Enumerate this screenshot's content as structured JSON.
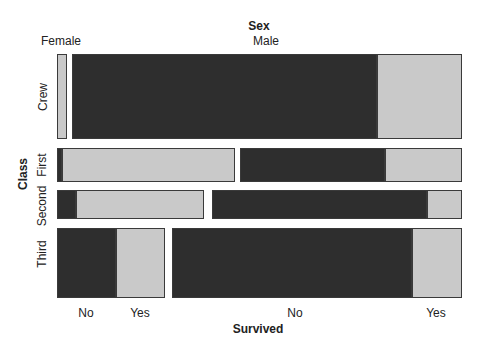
{
  "chart_data": {
    "type": "mosaic",
    "axes": {
      "top": {
        "title": "Sex",
        "category_labels": [
          {
            "text": "Female",
            "x": 61,
            "y": 41
          },
          {
            "text": "Male",
            "x": 266,
            "y": 41
          }
        ]
      },
      "left": {
        "title": "Class",
        "category_labels": [
          {
            "text": "Crew",
            "x": 43,
            "y": 97
          },
          {
            "text": "First",
            "x": 42,
            "y": 165
          },
          {
            "text": "Second",
            "x": 42,
            "y": 206
          },
          {
            "text": "Third",
            "x": 42,
            "y": 254
          }
        ]
      },
      "bottom": {
        "title": "Survived",
        "tick_labels": [
          {
            "text": "No",
            "x": 86,
            "y": 313
          },
          {
            "text": "Yes",
            "x": 140,
            "y": 313
          },
          {
            "text": "No",
            "x": 295,
            "y": 313
          },
          {
            "text": "Yes",
            "x": 436,
            "y": 313
          }
        ]
      }
    },
    "colors": {
      "no_fill": "#2e2e2e",
      "yes_fill": "#c9c9c9",
      "border": "#3a3a3a",
      "background": "#ffffff",
      "text": "#222222"
    },
    "layout": {
      "plot_x_range": [
        57,
        462
      ],
      "plot_y_range": [
        54,
        298
      ]
    },
    "rows": [
      {
        "label": "Crew",
        "y": 54,
        "height": 85,
        "height_share": 0.39,
        "cells": [
          {
            "sex": "Female",
            "survived": "Yes",
            "x": 57,
            "width": 10,
            "share": 1.0
          },
          {
            "sex": "Male",
            "survived": "No",
            "x": 72,
            "width": 305,
            "share": 0.78
          },
          {
            "sex": "Male",
            "survived": "Yes",
            "x": 377,
            "width": 85,
            "share": 0.22
          }
        ]
      },
      {
        "label": "First",
        "y": 148,
        "height": 34,
        "height_share": 0.16,
        "cells": [
          {
            "sex": "Female",
            "survived": "No",
            "x": 57,
            "width": 5,
            "share": 0.03
          },
          {
            "sex": "Female",
            "survived": "Yes",
            "x": 62,
            "width": 173,
            "share": 0.97
          },
          {
            "sex": "Male",
            "survived": "No",
            "x": 240,
            "width": 145,
            "share": 0.65
          },
          {
            "sex": "Male",
            "survived": "Yes",
            "x": 385,
            "width": 77,
            "share": 0.35
          }
        ]
      },
      {
        "label": "Second",
        "y": 190,
        "height": 29,
        "height_share": 0.13,
        "cells": [
          {
            "sex": "Female",
            "survived": "No",
            "x": 57,
            "width": 19,
            "share": 0.13
          },
          {
            "sex": "Female",
            "survived": "Yes",
            "x": 76,
            "width": 128,
            "share": 0.87
          },
          {
            "sex": "Male",
            "survived": "No",
            "x": 212,
            "width": 215,
            "share": 0.86
          },
          {
            "sex": "Male",
            "survived": "Yes",
            "x": 427,
            "width": 35,
            "share": 0.14
          }
        ]
      },
      {
        "label": "Third",
        "y": 228,
        "height": 70,
        "height_share": 0.32,
        "cells": [
          {
            "sex": "Female",
            "survived": "No",
            "x": 57,
            "width": 59,
            "share": 0.55
          },
          {
            "sex": "Female",
            "survived": "Yes",
            "x": 116,
            "width": 49,
            "share": 0.45
          },
          {
            "sex": "Male",
            "survived": "No",
            "x": 172,
            "width": 240,
            "share": 0.83
          },
          {
            "sex": "Male",
            "survived": "Yes",
            "x": 412,
            "width": 50,
            "share": 0.17
          }
        ]
      }
    ]
  }
}
